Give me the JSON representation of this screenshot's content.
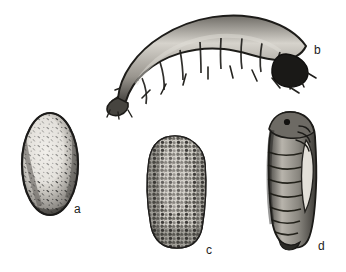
{
  "figure": {
    "background_color": "#ffffff",
    "ink_color": "#1c1c1c",
    "width_px": 346,
    "height_px": 272,
    "specimens": [
      {
        "label": "a",
        "name": "egg",
        "shape": "oval",
        "texture": "smooth speckled shell with dark stippling",
        "orientation": "upright",
        "bounds_px": {
          "x": 22,
          "y": 113,
          "w": 56,
          "h": 102
        },
        "label_pos_px": {
          "x": 74,
          "y": 203
        }
      },
      {
        "label": "b",
        "name": "larva",
        "shape": "arched segmented grub",
        "texture": "banded segments with lateral bristles and dark head capsule",
        "orientation": "arched horizontally, head at right",
        "bounds_px": {
          "x": 110,
          "y": 18,
          "w": 198,
          "h": 88
        },
        "label_pos_px": {
          "x": 314,
          "y": 44
        }
      },
      {
        "label": "c",
        "name": "cocoon",
        "shape": "rounded oblong",
        "texture": "coarse granular soil-encrusted surface",
        "orientation": "upright",
        "bounds_px": {
          "x": 148,
          "y": 135,
          "w": 58,
          "h": 113
        },
        "label_pos_px": {
          "x": 206,
          "y": 244
        }
      },
      {
        "label": "d",
        "name": "pupa",
        "shape": "elongated capsule",
        "texture": "ringed abdominal segments with wing and leg cases",
        "orientation": "upright, head at top",
        "bounds_px": {
          "x": 264,
          "y": 112,
          "w": 52,
          "h": 135
        },
        "label_pos_px": {
          "x": 318,
          "y": 240
        }
      }
    ],
    "labels": {
      "a": "a",
      "b": "b",
      "c": "c",
      "d": "d"
    }
  }
}
